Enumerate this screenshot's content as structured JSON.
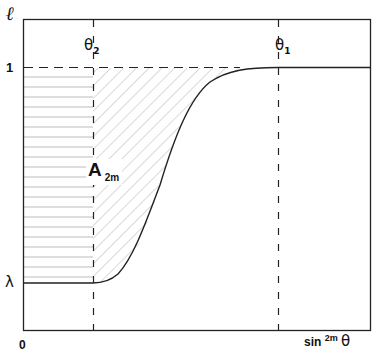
{
  "figure": {
    "y_axis_label": "ℓ",
    "x_axis_label_base": "sin",
    "x_axis_label_exp": "2m",
    "x_axis_label_var": "θ",
    "origin_label": "0",
    "y_tick_one": "1",
    "y_tick_lambda": "λ",
    "theta2_base": "θ",
    "theta2_sub": "2",
    "theta1_base": "θ",
    "theta1_sub": "1",
    "area_label_base": "A",
    "area_label_sub": "2m"
  },
  "colors": {
    "line": "#222222",
    "hatch": "#9a9a9a",
    "background": "#ffffff"
  }
}
